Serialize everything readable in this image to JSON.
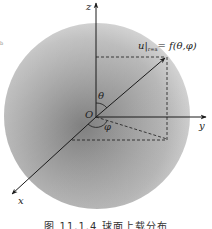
{
  "figure": {
    "caption": "图 11.1.4  球面上载分布",
    "margin_mark": "b",
    "labels": {
      "z_axis": "z",
      "y_axis": "y",
      "x_axis": "x",
      "origin": "O",
      "theta": "θ",
      "phi": "φ",
      "boundary_u": "u",
      "boundary_sub": "r=a",
      "boundary_rhs": "= f(θ,φ)"
    },
    "colors": {
      "sphere_light": "#d4d4d4",
      "sphere_mid": "#a8a8a8",
      "sphere_dark": "#8c8c8c",
      "line": "#1a1a1a",
      "background": "#ffffff"
    },
    "geometry": {
      "sphere_center": [
        97,
        116
      ],
      "sphere_radius": 93,
      "origin": [
        96,
        117
      ],
      "point_tip": [
        166,
        57
      ],
      "projection_point": [
        167,
        139
      ]
    }
  }
}
